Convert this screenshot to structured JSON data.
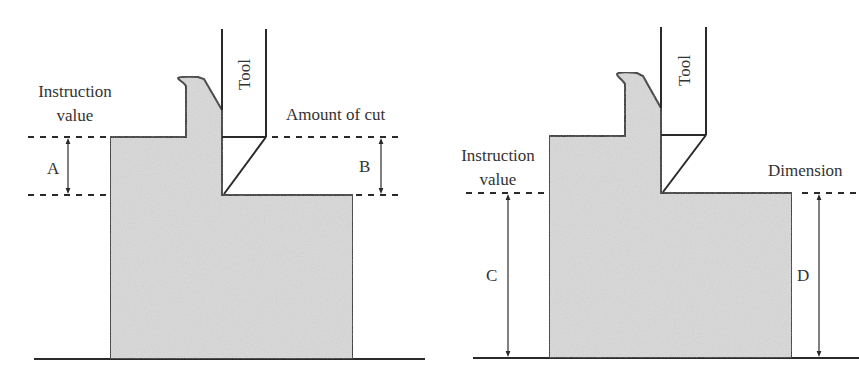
{
  "colors": {
    "line": "#2a2a2a",
    "fill": "#d9d9d9",
    "text": "#333333",
    "background": "#ffffff"
  },
  "left_diagram": {
    "tool_label": "Tool",
    "instruction_label_line1": "Instruction",
    "instruction_label_line2": "value",
    "cut_label": "Amount of cut",
    "dim_a_label": "A",
    "dim_b_label": "B"
  },
  "right_diagram": {
    "tool_label": "Tool",
    "instruction_label_line1": "Instruction",
    "instruction_label_line2": "value",
    "dimension_label": "Dimension",
    "dim_c_label": "C",
    "dim_d_label": "D"
  }
}
